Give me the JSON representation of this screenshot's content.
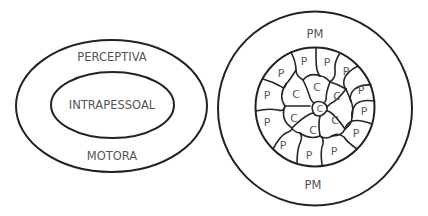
{
  "left_diagram": {
    "outer_label_top": "PERCEPTIVA",
    "inner_label": "INTRAPESSOAL",
    "outer_label_bottom": "MOTORA"
  },
  "right_diagram": {
    "ring_label_top": "PM",
    "ring_label_bottom": "PM",
    "peripheral_cells": [
      {
        "label": "P",
        "x": 304,
        "y": 61
      },
      {
        "label": "P",
        "x": 327,
        "y": 62
      },
      {
        "label": "P",
        "x": 346,
        "y": 71
      },
      {
        "label": "P",
        "x": 360,
        "y": 89
      },
      {
        "label": "P",
        "x": 363,
        "y": 111
      },
      {
        "label": "P",
        "x": 355,
        "y": 133
      },
      {
        "label": "P",
        "x": 334,
        "y": 151
      },
      {
        "label": "P",
        "x": 308,
        "y": 155
      },
      {
        "label": "P",
        "x": 283,
        "y": 145
      },
      {
        "label": "P",
        "x": 267,
        "y": 122
      },
      {
        "label": "P",
        "x": 267,
        "y": 95
      },
      {
        "label": "P",
        "x": 281,
        "y": 73
      }
    ],
    "central_cells": [
      {
        "label": "C",
        "x": 296,
        "y": 93
      },
      {
        "label": "C",
        "x": 317,
        "y": 86
      },
      {
        "label": "C",
        "x": 337,
        "y": 96
      },
      {
        "label": "C",
        "x": 335,
        "y": 119
      },
      {
        "label": "C",
        "x": 313,
        "y": 130
      },
      {
        "label": "C",
        "x": 292,
        "y": 118
      },
      {
        "label": "C",
        "x": 321,
        "y": 108
      }
    ]
  }
}
